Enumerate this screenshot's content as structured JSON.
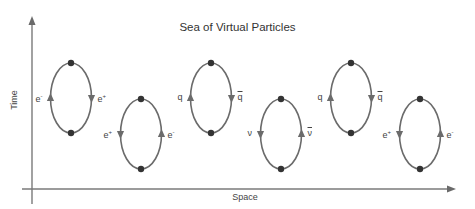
{
  "title": "Sea of Virtual Particles",
  "axes": {
    "x_label": "Space",
    "y_label": "Time"
  },
  "colors": {
    "line": "#6b6b6b",
    "vertex": "#333333",
    "text": "#444444"
  },
  "loops": [
    {
      "row": "upper",
      "left_label": "e",
      "left_sup": "-",
      "left_bar": false,
      "left_arrow": "up",
      "right_label": "e",
      "right_sup": "+",
      "right_bar": false,
      "right_arrow": "down"
    },
    {
      "row": "lower",
      "left_label": "e",
      "left_sup": "+",
      "left_bar": false,
      "left_arrow": "down",
      "right_label": "e",
      "right_sup": "-",
      "right_bar": false,
      "right_arrow": "up"
    },
    {
      "row": "upper",
      "left_label": "q",
      "left_sup": "",
      "left_bar": false,
      "left_arrow": "up",
      "right_label": "q",
      "right_sup": "",
      "right_bar": true,
      "right_arrow": "down"
    },
    {
      "row": "lower",
      "left_label": "ν",
      "left_sup": "",
      "left_bar": false,
      "left_arrow": "down",
      "right_label": "ν",
      "right_sup": "",
      "right_bar": true,
      "right_arrow": "up"
    },
    {
      "row": "upper",
      "left_label": "q",
      "left_sup": "",
      "left_bar": false,
      "left_arrow": "up",
      "right_label": "q",
      "right_sup": "",
      "right_bar": true,
      "right_arrow": "down"
    },
    {
      "row": "lower",
      "left_label": "e",
      "left_sup": "+",
      "left_bar": false,
      "left_arrow": "down",
      "right_label": "e",
      "right_sup": "-",
      "right_bar": false,
      "right_arrow": "up"
    }
  ]
}
